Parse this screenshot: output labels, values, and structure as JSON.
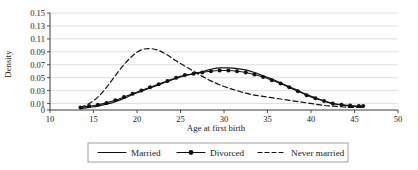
{
  "chart_data": {
    "type": "line",
    "title": "",
    "xlabel": "Age at first birth",
    "ylabel": "Density",
    "xlim": [
      10,
      50
    ],
    "ylim": [
      0,
      0.15
    ],
    "xticks": [
      10,
      15,
      20,
      25,
      30,
      35,
      40,
      45,
      50
    ],
    "yticks": [
      0,
      0.01,
      0.03,
      0.05,
      0.07,
      0.09,
      0.11,
      0.13,
      0.15
    ],
    "ytick_labels": [
      "0",
      "0.01",
      "0.03",
      "0.05",
      "0.07",
      "0.09",
      "0.11",
      "0.13",
      "0.15"
    ],
    "xtick_labels": [
      "10",
      "15",
      "20",
      "25",
      "30",
      "35",
      "40",
      "45",
      "50"
    ],
    "grid": true,
    "grid_axis": "y",
    "legend_position": "bottom",
    "series": [
      {
        "name": "Married",
        "style": "solid",
        "marker": "none",
        "color": "#111111",
        "x": [
          13.5,
          14.5,
          15.5,
          16.5,
          17.5,
          18.5,
          19.5,
          20.5,
          21.5,
          22.5,
          23.5,
          24.5,
          25.5,
          26.5,
          27.5,
          28.5,
          29.5,
          30.5,
          31.5,
          32.5,
          33.5,
          34.5,
          35.5,
          36.5,
          37.5,
          38.5,
          39.5,
          40.5,
          41.5,
          42.5,
          43.5,
          44.5,
          45.5,
          46.0
        ],
        "values": [
          0.002,
          0.004,
          0.006,
          0.009,
          0.013,
          0.018,
          0.024,
          0.029,
          0.034,
          0.039,
          0.044,
          0.049,
          0.053,
          0.056,
          0.059,
          0.063,
          0.065,
          0.065,
          0.064,
          0.062,
          0.058,
          0.053,
          0.048,
          0.042,
          0.036,
          0.03,
          0.024,
          0.019,
          0.014,
          0.01,
          0.008,
          0.006,
          0.005,
          0.005
        ]
      },
      {
        "name": "Divorced",
        "style": "solid",
        "marker": "circle",
        "color": "#111111",
        "x": [
          13.5,
          14.5,
          15.5,
          16.5,
          17.5,
          18.5,
          19.5,
          20.5,
          21.5,
          22.5,
          23.5,
          24.5,
          25.5,
          26.5,
          27.5,
          28.5,
          29.5,
          30.5,
          31.5,
          32.5,
          33.5,
          34.5,
          35.5,
          36.5,
          37.5,
          38.5,
          39.5,
          40.5,
          41.5,
          42.5,
          43.5,
          44.5,
          45.5,
          46.0
        ],
        "values": [
          0.004,
          0.006,
          0.008,
          0.011,
          0.015,
          0.02,
          0.025,
          0.03,
          0.035,
          0.04,
          0.045,
          0.05,
          0.054,
          0.056,
          0.058,
          0.06,
          0.061,
          0.061,
          0.06,
          0.058,
          0.055,
          0.051,
          0.046,
          0.041,
          0.035,
          0.029,
          0.023,
          0.018,
          0.014,
          0.01,
          0.008,
          0.007,
          0.006,
          0.006
        ]
      },
      {
        "name": "Never married",
        "style": "dashed",
        "marker": "none",
        "color": "#111111",
        "x": [
          13.5,
          14.5,
          15.5,
          16.5,
          17.5,
          18.5,
          19.5,
          20.5,
          21.5,
          22.5,
          23.5,
          24.5,
          25.5,
          26.5,
          27.5,
          28.5,
          29.5,
          30.5,
          31.5,
          32.5,
          33.5,
          34.5,
          35.5,
          36.5,
          37.5,
          38.5,
          39.5,
          40.5,
          41.5,
          42.5,
          43.5,
          44.5,
          45.5,
          46.0
        ],
        "values": [
          0.004,
          0.01,
          0.02,
          0.035,
          0.053,
          0.07,
          0.084,
          0.093,
          0.095,
          0.092,
          0.085,
          0.076,
          0.068,
          0.06,
          0.052,
          0.045,
          0.039,
          0.034,
          0.03,
          0.026,
          0.023,
          0.021,
          0.019,
          0.017,
          0.015,
          0.013,
          0.011,
          0.009,
          0.007,
          0.006,
          0.005,
          0.004,
          0.004,
          0.004
        ]
      }
    ]
  },
  "legend": {
    "items": [
      {
        "label": "Married",
        "style": "solid",
        "marker": "none"
      },
      {
        "label": "Divorced",
        "style": "solid",
        "marker": "circle"
      },
      {
        "label": "Never married",
        "style": "dashed",
        "marker": "none"
      }
    ]
  },
  "colors": {
    "ink": "#111111",
    "grid": "#c9c9c9",
    "axis": "#3a3a3a",
    "background": "#ffffff"
  }
}
